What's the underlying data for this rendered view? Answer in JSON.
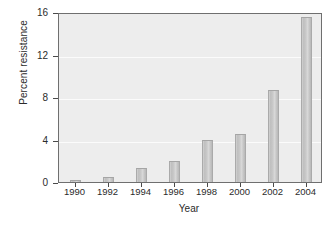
{
  "chart_data": {
    "type": "bar",
    "title": "",
    "xlabel": "Year",
    "ylabel": "Percent resistance",
    "categories": [
      "1990",
      "1992",
      "1994",
      "1996",
      "1998",
      "2000",
      "2002",
      "2004"
    ],
    "values": [
      0.2,
      0.5,
      1.3,
      2.0,
      4.0,
      4.5,
      8.7,
      15.5
    ],
    "ylim": [
      0,
      16
    ],
    "yticks": [
      "0",
      "4",
      "8",
      "12",
      "16"
    ],
    "ytick_values": [
      0,
      4,
      8,
      12,
      16
    ],
    "xticks": [
      "1990",
      "1992",
      "1994",
      "1996",
      "1998",
      "2000",
      "2002",
      "2004"
    ],
    "grid": "horizontal",
    "legend": "none",
    "series": [
      {
        "name": "Percent resistance",
        "values": [
          0.2,
          0.5,
          1.3,
          2.0,
          4.0,
          4.5,
          8.7,
          15.5
        ]
      }
    ],
    "colors": {
      "bar_fill": "#c9c9c9",
      "bar_edge": "#aaaaaa",
      "plot_background": "#ededed",
      "gridline": "#fbfbfb",
      "axis": "#6f6f6f",
      "text": "#2b2b2b",
      "figure_background": "#ffffff"
    }
  }
}
